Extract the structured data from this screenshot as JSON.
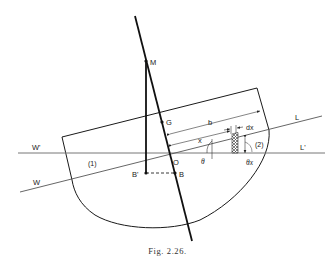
{
  "figure": {
    "caption": "Fig. 2.26.",
    "labels": {
      "M": "M",
      "G": "G",
      "O": "O",
      "B": "B",
      "B_prime": "B'",
      "W": "W",
      "W_prime": "W'",
      "L": "L",
      "L_prime": "L'",
      "b": "b",
      "x": "x",
      "dx": "dx",
      "theta": "θ",
      "theta_x": "θx",
      "region_1": "(1)",
      "region_2": "(2)"
    },
    "colors": {
      "line": "#1a1a1a",
      "waterline": "#777777",
      "background": "#ffffff"
    }
  }
}
